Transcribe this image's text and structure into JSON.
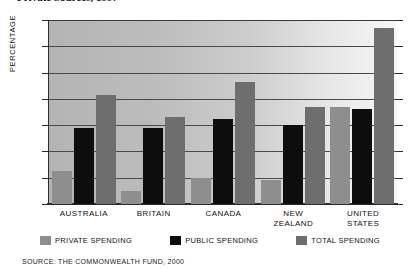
{
  "figure": {
    "title_clipped": "Private Sources, 1997",
    "source_note": "SOURCE: THE COMMONWEALTH FUND, 2000"
  },
  "axis": {
    "y_title": "PERCENTAGE",
    "ticks": [
      "14",
      "12",
      "10",
      "8",
      "6",
      "4",
      "2",
      "0"
    ]
  },
  "legend": {
    "items": [
      {
        "label": "PRIVATE SPENDING",
        "color": "#8e8e8e",
        "key": "private"
      },
      {
        "label": "PUBLIC SPENDING",
        "color": "#0d0d0d",
        "key": "public"
      },
      {
        "label": "TOTAL SPENDING",
        "color": "#6e6e6e",
        "key": "total"
      }
    ]
  },
  "categories": [
    {
      "line1": "AUSTRALIA",
      "line2": ""
    },
    {
      "line1": "BRITAIN",
      "line2": ""
    },
    {
      "line1": "CANADA",
      "line2": ""
    },
    {
      "line1": "NEW",
      "line2": "ZEALAND"
    },
    {
      "line1": "UNITED",
      "line2": "STATES"
    }
  ],
  "chart_data": {
    "type": "bar",
    "title": "Private Sources, 1997",
    "xlabel": "",
    "ylabel": "PERCENTAGE",
    "ylim": [
      0,
      14
    ],
    "yticks": [
      0,
      2,
      4,
      6,
      8,
      10,
      12,
      14
    ],
    "grid": true,
    "legend_position": "bottom",
    "categories": [
      "AUSTRALIA",
      "BRITAIN",
      "CANADA",
      "NEW ZEALAND",
      "UNITED STATES"
    ],
    "series": [
      {
        "name": "PRIVATE SPENDING",
        "color": "#8e8e8e",
        "values": [
          2.5,
          1.0,
          2.0,
          1.8,
          7.4
        ]
      },
      {
        "name": "PUBLIC SPENDING",
        "color": "#0d0d0d",
        "values": [
          5.8,
          5.8,
          6.5,
          6.0,
          7.2
        ]
      },
      {
        "name": "TOTAL SPENDING",
        "color": "#6e6e6e",
        "values": [
          8.3,
          6.6,
          9.3,
          7.4,
          13.4
        ]
      }
    ],
    "source": "SOURCE: THE COMMONWEALTH FUND, 2000"
  }
}
